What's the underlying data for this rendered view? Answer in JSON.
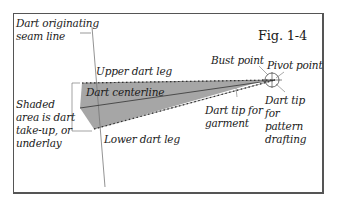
{
  "figure": {
    "title": "Fig. 1-4",
    "labels": {
      "seam_line": [
        "Dart originating",
        "seam line"
      ],
      "upper_leg": "Upper dart leg",
      "centerline": "Dart centerline",
      "shaded_area": [
        "Shaded",
        "area is dart",
        "take-up, or",
        "underlay"
      ],
      "lower_leg": "Lower dart leg",
      "bust_point": "Bust point",
      "pivot_point": "Pivot point",
      "tip_garment": [
        "Dart tip for",
        "garment"
      ],
      "tip_pattern": [
        "Dart tip",
        "for",
        "pattern",
        "drafting"
      ]
    },
    "colors": {
      "shading": "#a6a6a6",
      "line": "#333333",
      "border": "#555555"
    }
  }
}
